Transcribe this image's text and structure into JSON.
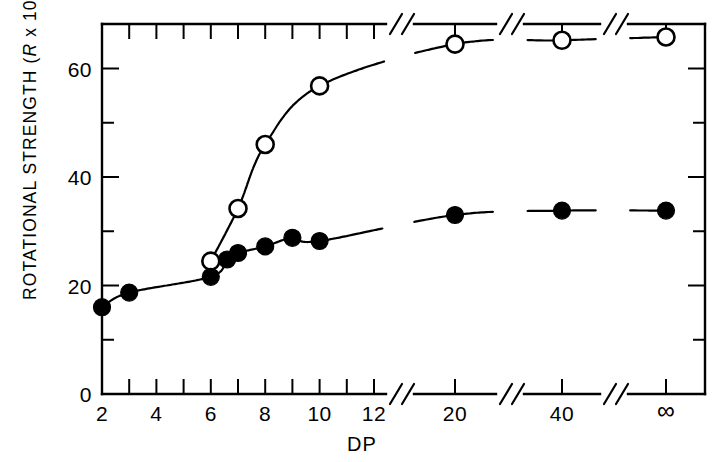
{
  "chart_data": {
    "type": "scatter",
    "title": "",
    "xlabel": "DP",
    "ylabel_text": "ROTATIONAL  STRENGTH  (",
    "ylabel_italic": "R",
    "ylabel_mid": " x 10",
    "ylabel_sup": "40",
    "ylabel_close": ")",
    "ylabel_full": "ROTATIONAL STRENGTH (R x 10^40)",
    "grid": false,
    "legend": "none",
    "ylim": [
      0,
      72
    ],
    "y_major_ticks": [
      0,
      20,
      40,
      60
    ],
    "y_major_labels": [
      "0",
      "20",
      "40",
      "60"
    ],
    "y_minor_ticks": [
      10,
      30,
      50,
      70
    ],
    "x_axis_type": "broken",
    "x_linear_ticks": [
      2,
      3,
      4,
      5,
      6,
      7,
      8,
      9,
      10,
      11,
      12,
      13
    ],
    "x_labeled_ticks": [
      2,
      4,
      6,
      8,
      10,
      12
    ],
    "x_labeled_text": [
      "2",
      "4",
      "6",
      "8",
      "10",
      "12"
    ],
    "x_break_labels": [
      "20",
      "40",
      "∞"
    ],
    "series": [
      {
        "name": "open-circles",
        "marker": "open-circle",
        "points": [
          {
            "x": 6,
            "y": 24.5,
            "label": "6"
          },
          {
            "x": 7,
            "y": 34.2,
            "label": "7"
          },
          {
            "x": 8,
            "y": 46.0,
            "label": "8"
          },
          {
            "x": 10,
            "y": 56.8,
            "label": "10"
          },
          {
            "x": 20,
            "y": 64.5,
            "label": "20"
          },
          {
            "x": 40,
            "y": 65.2,
            "label": "40"
          },
          {
            "x": 999,
            "y": 65.8,
            "label": "∞"
          }
        ]
      },
      {
        "name": "filled-circles",
        "marker": "filled-circle",
        "points": [
          {
            "x": 2,
            "y": 16.0,
            "label": "2"
          },
          {
            "x": 3,
            "y": 18.7,
            "label": "3"
          },
          {
            "x": 6,
            "y": 21.6,
            "label": "6"
          },
          {
            "x": 6.6,
            "y": 24.8,
            "label": "6.6"
          },
          {
            "x": 7,
            "y": 26.0,
            "label": "7"
          },
          {
            "x": 8,
            "y": 27.2,
            "label": "8"
          },
          {
            "x": 9,
            "y": 28.8,
            "label": "9"
          },
          {
            "x": 10,
            "y": 28.2,
            "label": "10"
          },
          {
            "x": 20,
            "y": 33.0,
            "label": "20"
          },
          {
            "x": 40,
            "y": 33.8,
            "label": "40"
          },
          {
            "x": 999,
            "y": 33.8,
            "label": "∞"
          }
        ]
      }
    ]
  },
  "colors": {
    "ink": "#000000",
    "paper": "#ffffff"
  }
}
